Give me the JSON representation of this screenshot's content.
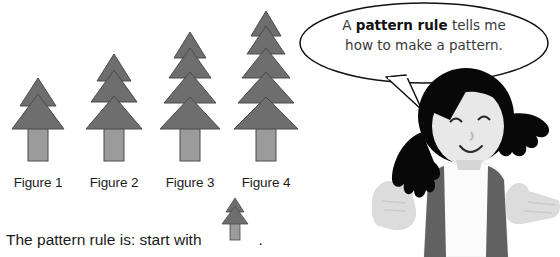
{
  "page": {
    "background_color": "#ffffff",
    "width": 560,
    "height": 257
  },
  "pattern": {
    "figures": [
      {
        "label": "Figure 1",
        "tiers": 1,
        "trunk": true
      },
      {
        "label": "Figure 2",
        "tiers": 2,
        "trunk": true
      },
      {
        "label": "Figure 3",
        "tiers": 3,
        "trunk": true
      },
      {
        "label": "Figure 4",
        "tiers": 4,
        "trunk": true
      }
    ],
    "foliage_color": "#6e6e6e",
    "trunk_color": "#9b9b9b",
    "outline_color": "#3a3a3a"
  },
  "rule_sentence": {
    "text": "The pattern rule is: start with",
    "period": ".",
    "icon_name": "tree-figure-1-icon"
  },
  "speech_bubble": {
    "line1_prefix": "A ",
    "line1_bold": "pattern rule",
    "line1_suffix": " tells me",
    "line2": "how to make a pattern.",
    "full_text": "A pattern rule tells me how to make a pattern.",
    "border_color": "#111111",
    "fill_color": "#ffffff"
  },
  "character": {
    "name": "girl-shrugging",
    "hair_color": "#080808",
    "skin_color": "#e8e8e8",
    "vest_color": "#616161",
    "shirt_color": "#fbfbfb",
    "hand_color": "#dcdcdc"
  },
  "colors": {
    "text": "#1a1a1a",
    "bubble_text": "#3a3a3a",
    "foliage": "#6e6e6e",
    "trunk": "#9b9b9b"
  }
}
